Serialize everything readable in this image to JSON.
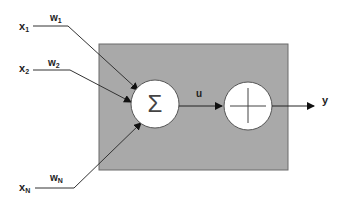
{
  "diagram": {
    "type": "neuron-model",
    "inputs": [
      {
        "name": "x",
        "subscript": "1",
        "weight": "w",
        "weight_subscript": "1"
      },
      {
        "name": "x",
        "subscript": "2",
        "weight": "w",
        "weight_subscript": "2"
      },
      {
        "name": "x",
        "subscript": "N",
        "weight": "w",
        "weight_subscript": "N"
      }
    ],
    "summation_symbol": "Σ",
    "activation_symbol": "+",
    "intermediate_label": "u",
    "output_label": "y",
    "colors": {
      "box_fill": "#a9a9a9",
      "box_stroke": "#6b6b6b",
      "node_fill": "#ffffff",
      "line": "#333333"
    }
  }
}
